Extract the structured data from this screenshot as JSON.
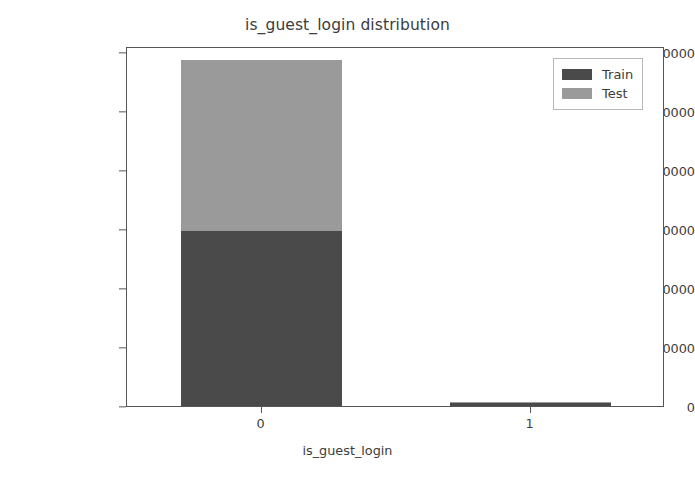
{
  "chart_data": {
    "type": "bar",
    "subtype": "stacked-bar",
    "title": "is_guest_login distribution",
    "xlabel": "is_guest_login",
    "ylabel": "Frequency",
    "categories": [
      "0",
      "1"
    ],
    "series": [
      {
        "name": "Train",
        "color": "#4a4a4a",
        "values": [
          148500,
          3100
        ]
      },
      {
        "name": "Test",
        "color": "#9a9a9a",
        "values": [
          144878,
          556
        ]
      }
    ],
    "bar_totals": [
      293378,
      3656
    ],
    "bar_total_labels": [
      "293378",
      "3656"
    ],
    "ylim": [
      0,
      305000
    ],
    "yticks": [
      0,
      50000,
      100000,
      150000,
      200000,
      250000,
      300000
    ],
    "ytick_labels": [
      "0",
      "50000",
      "100000",
      "150000",
      "200000",
      "250000",
      "300000"
    ],
    "xtick_labels": [
      "0",
      "1"
    ],
    "grid": false,
    "legend_position": "upper right",
    "legend_entries": [
      "Train",
      "Test"
    ]
  }
}
